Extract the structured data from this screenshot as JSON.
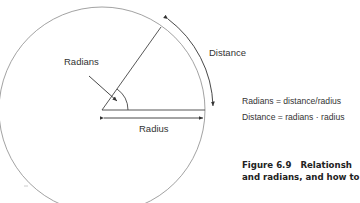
{
  "diagram": {
    "labels": {
      "radians": "Radians",
      "distance": "Distance",
      "radius": "Radius"
    },
    "formulas": [
      "Radians = distance/radius",
      "Distance = radians · radius"
    ],
    "caption": {
      "number": "Figure 6.9",
      "line1": "Relationsh",
      "line2": "and radians, and how to",
      "line3": "..."
    },
    "colors": {
      "line": "#444444",
      "circle": "#888888",
      "text": "#333333"
    }
  }
}
